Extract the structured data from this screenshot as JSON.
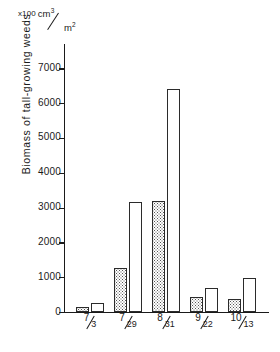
{
  "figure": {
    "unit_label": {
      "multiplier": "x100",
      "numerator": "cm",
      "numerator_sup": "3",
      "denominator": "m",
      "denominator_sup": "2",
      "full_text": "x100 cm3/m2"
    },
    "y_axis_title": "Biomass of tall-growing weeds"
  },
  "chart_data": {
    "type": "bar",
    "title": "",
    "subtitle": "",
    "xlabel": "",
    "ylabel": "Biomass of tall-growing weeds",
    "unit": "x100 cm3/m2",
    "categories": [
      "7/3",
      "7/29",
      "8/31",
      "9/22",
      "10/13"
    ],
    "category_parts": [
      {
        "numerator": "7",
        "denominator": "3"
      },
      {
        "numerator": "7",
        "denominator": "29"
      },
      {
        "numerator": "8",
        "denominator": "31"
      },
      {
        "numerator": "9",
        "denominator": "22"
      },
      {
        "numerator": "10",
        "denominator": "13"
      }
    ],
    "series": [
      {
        "name": "stippled",
        "fill": "stippled",
        "values": [
          130,
          1270,
          3200,
          430,
          380
        ]
      },
      {
        "name": "open",
        "fill": "white",
        "values": [
          270,
          3150,
          6400,
          680,
          980
        ]
      }
    ],
    "ylim": [
      0,
      7700
    ],
    "yticks": [
      0,
      1000,
      2000,
      3000,
      4000,
      5000,
      6000,
      7000
    ],
    "ytick_labels": [
      "0",
      "1000",
      "2000",
      "3000",
      "4000",
      "5000",
      "6000",
      "7000"
    ],
    "grid": false,
    "legend": "none",
    "axis_color": "#1a1a1a",
    "bar_edge_color": "#2b2b2b",
    "bar_fill_color": "#ffffff",
    "stipple_color": "#555555"
  }
}
